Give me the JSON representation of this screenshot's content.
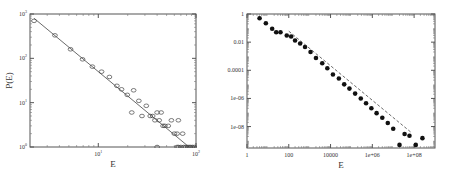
{
  "chart_data": [
    {
      "type": "scatter",
      "title": "",
      "xlabel": "E",
      "ylabel": "P(E)",
      "xscale": "log",
      "yscale": "log",
      "xlim": [
        2,
        100
      ],
      "ylim": [
        1,
        1000
      ],
      "x_ticks": [
        {
          "value": 10,
          "label": "10",
          "exp": "1"
        },
        {
          "value": 100,
          "label": "10",
          "exp": "2"
        }
      ],
      "y_ticks": [
        {
          "value": 1,
          "label": "10",
          "exp": "0"
        },
        {
          "value": 10,
          "label": "10",
          "exp": "1"
        },
        {
          "value": 100,
          "label": "10",
          "exp": "2"
        },
        {
          "value": 1000,
          "label": "10",
          "exp": "3"
        }
      ],
      "grid": false,
      "marker": "open-circle",
      "series": [
        {
          "name": "data",
          "x": [
            2.2,
            3.6,
            5.2,
            6.9,
            8.7,
            10.8,
            13,
            15.5,
            17.3,
            19.8,
            23,
            22,
            26,
            31,
            28,
            34,
            40,
            36,
            42,
            38,
            48,
            44,
            52,
            46,
            56,
            60,
            64,
            73,
            66,
            40,
            64,
            66,
            70,
            75,
            78,
            82,
            85,
            88,
            92,
            96
          ],
          "y": [
            700,
            330,
            160,
            95,
            65,
            50,
            38,
            24,
            20,
            15,
            19,
            6,
            11,
            8.5,
            5,
            5,
            6,
            5,
            4,
            4,
            3,
            6,
            3,
            3,
            4,
            2,
            2,
            2,
            4,
            1,
            1,
            1,
            1,
            1,
            1,
            1,
            1,
            1,
            1,
            1
          ]
        },
        {
          "name": "fit",
          "type": "line",
          "style": "solid",
          "x": [
            2.2,
            85
          ],
          "y": [
            800,
            1
          ]
        }
      ]
    },
    {
      "type": "scatter",
      "title": "",
      "xlabel": "E",
      "ylabel": "P(E)",
      "xscale": "log",
      "yscale": "log",
      "xlim": [
        1,
        1000000000
      ],
      "ylim": [
        3e-10,
        1
      ],
      "x_ticks": [
        {
          "value": 1,
          "label": "1"
        },
        {
          "value": 100,
          "label": "100"
        },
        {
          "value": 10000,
          "label": "10000"
        },
        {
          "value": 1000000,
          "label": "1e+06"
        },
        {
          "value": 100000000,
          "label": "1e+08"
        }
      ],
      "y_ticks": [
        {
          "value": 1,
          "label": "1"
        },
        {
          "value": 0.01,
          "label": "0.01"
        },
        {
          "value": 0.0001,
          "label": "0.0001"
        },
        {
          "value": 1e-06,
          "label": "1e-06"
        },
        {
          "value": 1e-08,
          "label": "1e-08"
        }
      ],
      "grid": false,
      "marker": "filled-circle",
      "series": [
        {
          "name": "data",
          "x": [
            4,
            8,
            16,
            25,
            40,
            80,
            130,
            200,
            350,
            600,
            1100,
            2000,
            4000,
            7000,
            13000,
            25000,
            45000,
            80000,
            150000,
            280000,
            500000,
            900000,
            1600000,
            3000000,
            5500000,
            10000000,
            20000000,
            35000000,
            60000000,
            120000000,
            250000000
          ],
          "y": [
            0.5,
            0.22,
            0.09,
            0.05,
            0.05,
            0.03,
            0.025,
            0.013,
            0.008,
            0.0045,
            0.002,
            0.00075,
            0.00032,
            0.00014,
            5e-05,
            2.6e-05,
            1e-05,
            5e-06,
            2.2e-06,
            1e-06,
            4.5e-07,
            2e-07,
            9e-08,
            4.2e-08,
            1.8e-08,
            7e-09,
            5e-10,
            3e-09,
            2.2e-09,
            5e-10,
            1.5e-09
          ]
        },
        {
          "name": "fit",
          "type": "line",
          "style": "dashed",
          "x": [
            100,
            70000000
          ],
          "y": [
            0.06,
            4e-09
          ]
        }
      ]
    }
  ],
  "panels": {
    "left": {
      "xlabel": "E",
      "ylabel": "P(E)"
    },
    "right": {
      "xlabel": "E",
      "ylabel": "P(E)"
    }
  }
}
